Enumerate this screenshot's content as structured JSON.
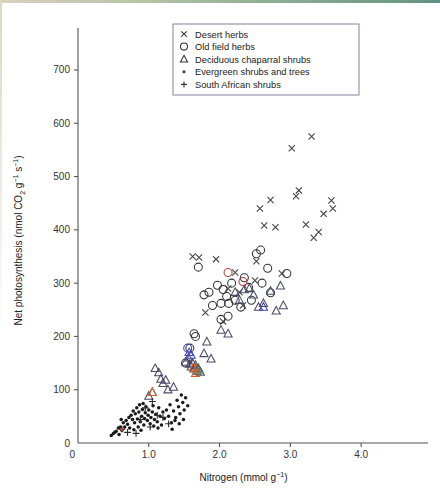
{
  "chart_data": {
    "type": "scatter",
    "title": "",
    "xlabel": "Nitrogen (mmol g-1)",
    "ylabel": "Net photosynthesis (nmol CO2 g-1 s-1)",
    "xlabel_parts": {
      "name": "Nitrogen (mmol g",
      "exp": "−1",
      "tail": ")"
    },
    "ylabel_parts": {
      "name": "Net photosynthesis (nmol CO",
      "sub": "2",
      "mid": " g",
      "exp1": "−1",
      "mid2": " s",
      "exp2": "−1",
      "tail": ")"
    },
    "xlim": [
      0,
      4.45
    ],
    "ylim": [
      0,
      760
    ],
    "xticks": [
      0,
      1.0,
      2.0,
      3.0,
      4.0
    ],
    "xticklabels": [
      "0",
      "1.0",
      "2.0",
      "3.0",
      "4.0"
    ],
    "yticks": [
      0,
      100,
      200,
      300,
      400,
      500,
      600,
      700
    ],
    "yticklabels": [
      "0",
      "100",
      "200",
      "300",
      "400",
      "500",
      "600",
      "700"
    ],
    "grid": false,
    "legend_position": "top-center",
    "series": [
      {
        "name": "Desert herbs",
        "marker": "x",
        "color": "#444444",
        "points": [
          [
            1.62,
            350
          ],
          [
            1.71,
            348
          ],
          [
            1.95,
            345
          ],
          [
            2.12,
            290
          ],
          [
            2.22,
            320
          ],
          [
            2.28,
            283
          ],
          [
            2.5,
            305
          ],
          [
            2.52,
            341
          ],
          [
            2.57,
            440
          ],
          [
            2.63,
            408
          ],
          [
            2.72,
            456
          ],
          [
            2.79,
            405
          ],
          [
            2.88,
            318
          ],
          [
            3.02,
            553
          ],
          [
            3.08,
            463
          ],
          [
            3.12,
            474
          ],
          [
            3.22,
            410
          ],
          [
            3.3,
            575
          ],
          [
            3.33,
            385
          ],
          [
            3.4,
            396
          ],
          [
            3.47,
            430
          ],
          [
            3.58,
            455
          ],
          [
            3.6,
            440
          ],
          [
            1.8,
            245
          ],
          [
            2.05,
            228
          ],
          [
            2.33,
            258
          ]
        ]
      },
      {
        "name": "Old field herbs",
        "marker": "o",
        "color": "#333333",
        "points": [
          [
            1.7,
            330
          ],
          [
            1.78,
            278
          ],
          [
            1.85,
            283
          ],
          [
            1.9,
            258
          ],
          [
            1.97,
            296
          ],
          [
            2.02,
            262
          ],
          [
            2.05,
            288
          ],
          [
            2.1,
            275
          ],
          [
            2.13,
            262
          ],
          [
            2.17,
            300
          ],
          [
            2.22,
            268
          ],
          [
            2.3,
            255
          ],
          [
            2.35,
            310
          ],
          [
            2.41,
            292
          ],
          [
            2.45,
            268
          ],
          [
            2.52,
            355
          ],
          [
            2.58,
            362
          ],
          [
            2.6,
            300
          ],
          [
            2.68,
            328
          ],
          [
            2.72,
            282
          ],
          [
            1.64,
            205
          ],
          [
            1.66,
            200
          ],
          [
            1.58,
            178
          ],
          [
            2.02,
            232
          ],
          [
            2.12,
            238
          ],
          [
            2.95,
            318
          ],
          [
            1.52,
            150
          ]
        ]
      },
      {
        "name": "Deciduous chaparral shrubs",
        "marker": "triangle",
        "color": "#4a4a6a",
        "points": [
          [
            1.09,
            140
          ],
          [
            1.14,
            132
          ],
          [
            1.17,
            120
          ],
          [
            1.2,
            112
          ],
          [
            1.24,
            118
          ],
          [
            1.27,
            100
          ],
          [
            1.35,
            105
          ],
          [
            1.52,
            152
          ],
          [
            1.56,
            160
          ],
          [
            1.58,
            148
          ],
          [
            1.6,
            143
          ],
          [
            1.62,
            150
          ],
          [
            1.64,
            139
          ],
          [
            1.66,
            146
          ],
          [
            1.68,
            135
          ],
          [
            1.7,
            140
          ],
          [
            1.73,
            133
          ],
          [
            1.78,
            168
          ],
          [
            1.82,
            190
          ],
          [
            1.88,
            158
          ],
          [
            2.02,
            212
          ],
          [
            2.12,
            205
          ],
          [
            2.22,
            283
          ],
          [
            2.28,
            268
          ],
          [
            2.35,
            288
          ],
          [
            2.42,
            290
          ],
          [
            2.48,
            278
          ],
          [
            2.55,
            255
          ],
          [
            2.62,
            262
          ],
          [
            2.72,
            285
          ],
          [
            2.8,
            248
          ],
          [
            2.86,
            295
          ],
          [
            2.9,
            258
          ],
          [
            1.0,
            88
          ],
          [
            1.05,
            95
          ]
        ]
      },
      {
        "name": "Evergreen shrubs and trees",
        "marker": "dot",
        "color": "#1a1a1a",
        "points": [
          [
            0.5,
            18
          ],
          [
            0.54,
            22
          ],
          [
            0.57,
            28
          ],
          [
            0.6,
            30
          ],
          [
            0.62,
            24
          ],
          [
            0.64,
            38
          ],
          [
            0.66,
            30
          ],
          [
            0.68,
            42
          ],
          [
            0.7,
            35
          ],
          [
            0.72,
            48
          ],
          [
            0.73,
            28
          ],
          [
            0.75,
            52
          ],
          [
            0.77,
            44
          ],
          [
            0.78,
            60
          ],
          [
            0.8,
            38
          ],
          [
            0.81,
            55
          ],
          [
            0.83,
            66
          ],
          [
            0.84,
            45
          ],
          [
            0.86,
            58
          ],
          [
            0.87,
            72
          ],
          [
            0.88,
            40
          ],
          [
            0.9,
            50
          ],
          [
            0.91,
            63
          ],
          [
            0.92,
            74
          ],
          [
            0.94,
            46
          ],
          [
            0.95,
            57
          ],
          [
            0.96,
            68
          ],
          [
            0.98,
            42
          ],
          [
            0.99,
            52
          ],
          [
            1.0,
            62
          ],
          [
            1.02,
            36
          ],
          [
            1.03,
            48
          ],
          [
            1.05,
            58
          ],
          [
            1.06,
            70
          ],
          [
            1.08,
            44
          ],
          [
            1.1,
            54
          ],
          [
            1.12,
            40
          ],
          [
            1.14,
            66
          ],
          [
            1.16,
            50
          ],
          [
            1.18,
            34
          ],
          [
            1.2,
            58
          ],
          [
            1.22,
            46
          ],
          [
            1.25,
            62
          ],
          [
            1.28,
            50
          ],
          [
            1.3,
            72
          ],
          [
            1.32,
            38
          ],
          [
            1.35,
            60
          ],
          [
            1.38,
            48
          ],
          [
            1.4,
            80
          ],
          [
            1.42,
            68
          ],
          [
            1.44,
            55
          ],
          [
            1.46,
            90
          ],
          [
            1.48,
            76
          ],
          [
            1.5,
            62
          ],
          [
            1.52,
            85
          ],
          [
            1.55,
            70
          ],
          [
            0.47,
            14
          ],
          [
            0.52,
            20
          ],
          [
            0.58,
            16
          ],
          [
            0.61,
            44
          ],
          [
            0.85,
            30
          ],
          [
            0.93,
            34
          ],
          [
            1.07,
            32
          ],
          [
            1.13,
            28
          ],
          [
            1.33,
            26
          ],
          [
            1.37,
            42
          ],
          [
            1.43,
            36
          ],
          [
            1.49,
            44
          ],
          [
            0.79,
            25
          ],
          [
            0.89,
            24
          ]
        ]
      },
      {
        "name": "South African shrubs",
        "marker": "plus",
        "color": "#2b2b2b",
        "points": [
          [
            0.62,
            26
          ],
          [
            0.7,
            20
          ],
          [
            0.88,
            44
          ],
          [
            0.95,
            66
          ],
          [
            1.02,
            30
          ],
          [
            1.05,
            78
          ],
          [
            1.12,
            52
          ],
          [
            1.2,
            48
          ],
          [
            0.82,
            18
          ],
          [
            1.28,
            36
          ]
        ]
      }
    ],
    "highlight_colors": {
      "blue": "#3a46b8",
      "orange": "#d2622a",
      "green": "#2f8a6a",
      "red": "#b8423a"
    },
    "highlighted_points": [
      {
        "x": 1.55,
        "y": 178,
        "marker": "o",
        "color": "#3a46b8"
      },
      {
        "x": 1.57,
        "y": 170,
        "marker": "triangle",
        "color": "#3a46b8"
      },
      {
        "x": 1.6,
        "y": 165,
        "marker": "triangle",
        "color": "#3a46b8"
      },
      {
        "x": 1.63,
        "y": 141,
        "marker": "triangle",
        "color": "#d2622a"
      },
      {
        "x": 1.67,
        "y": 139,
        "marker": "triangle",
        "color": "#d2622a"
      },
      {
        "x": 1.7,
        "y": 137,
        "marker": "triangle",
        "color": "#2f8a6a"
      },
      {
        "x": 1.66,
        "y": 131,
        "marker": "triangle",
        "color": "#d2622a"
      },
      {
        "x": 2.12,
        "y": 320,
        "marker": "o",
        "color": "#b8423a"
      },
      {
        "x": 2.33,
        "y": 303,
        "marker": "o",
        "color": "#b8423a"
      },
      {
        "x": 2.62,
        "y": 255,
        "marker": "triangle",
        "color": "#3a46b8"
      },
      {
        "x": 1.05,
        "y": 95,
        "marker": "triangle",
        "color": "#d2622a"
      },
      {
        "x": 0.62,
        "y": 26,
        "marker": "dot",
        "color": "#b8423a"
      }
    ]
  },
  "legend": {
    "items": [
      {
        "label": "Desert herbs",
        "marker": "x"
      },
      {
        "label": "Old field herbs",
        "marker": "o"
      },
      {
        "label": "Deciduous chaparral shrubs",
        "marker": "triangle"
      },
      {
        "label": "Evergreen shrubs and trees",
        "marker": "dot"
      },
      {
        "label": "South African shrubs",
        "marker": "plus"
      }
    ]
  }
}
